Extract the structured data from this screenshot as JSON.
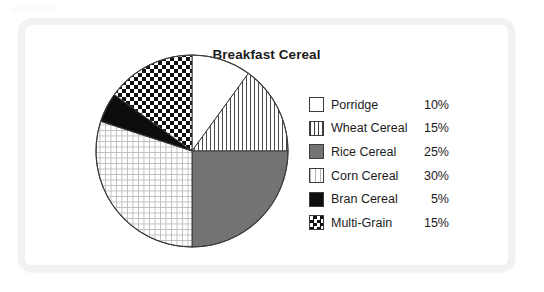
{
  "card": {
    "background_color": "#ffffff",
    "border_color": "#f2f2f2"
  },
  "chart_data": {
    "type": "pie",
    "title": "Breakfast Cereal",
    "xlabel": "",
    "ylabel": "",
    "legend_position": "right",
    "start_angle_deg": 0,
    "direction": "clockwise",
    "categories": [
      "Porridge",
      "Wheat Cereal",
      "Rice Cereal",
      "Corn Cereal",
      "Bran Cereal",
      "Multi-Grain"
    ],
    "values": [
      10,
      15,
      25,
      30,
      5,
      15
    ],
    "value_labels": [
      "10%",
      "15%",
      "25%",
      "30%",
      "5%",
      "15%"
    ],
    "slices": [
      {
        "label": "Porridge",
        "value": 10,
        "value_label": "10%",
        "pattern": "empty",
        "swatch_class": "sw-empty",
        "fill": "#ffffff",
        "start_deg": 0,
        "end_deg": 36
      },
      {
        "label": "Wheat Cereal",
        "value": 15,
        "value_label": "15%",
        "pattern": "vertical-lines",
        "swatch_class": "sw-vlines",
        "fill": "url(#pat-vlines)",
        "start_deg": 36,
        "end_deg": 90
      },
      {
        "label": "Rice Cereal",
        "value": 25,
        "value_label": "25%",
        "pattern": "solid-gray",
        "swatch_class": "sw-solidgray",
        "fill": "#737373",
        "start_deg": 90,
        "end_deg": 180
      },
      {
        "label": "Corn Cereal",
        "value": 30,
        "value_label": "30%",
        "pattern": "grid",
        "swatch_class": "sw-grid",
        "fill": "url(#pat-grid)",
        "start_deg": 180,
        "end_deg": 288
      },
      {
        "label": "Bran Cereal",
        "value": 5,
        "value_label": "5%",
        "pattern": "solid-black",
        "swatch_class": "sw-black",
        "fill": "#0d0d0d",
        "start_deg": 288,
        "end_deg": 306
      },
      {
        "label": "Multi-Grain",
        "value": 15,
        "value_label": "15%",
        "pattern": "checkerboard",
        "swatch_class": "sw-checker",
        "fill": "url(#pat-checker)",
        "start_deg": 306,
        "end_deg": 360
      }
    ],
    "total": 100,
    "units": "percent",
    "outline_color": "#3c3c3c"
  },
  "legend": {
    "rows": [
      {
        "label": "Porridge",
        "value": "10%"
      },
      {
        "label": "Wheat Cereal",
        "value": "15%"
      },
      {
        "label": "Rice Cereal",
        "value": "25%"
      },
      {
        "label": "Corn Cereal",
        "value": "30%"
      },
      {
        "label": "Bran Cereal",
        "value": "5%"
      },
      {
        "label": "Multi-Grain",
        "value": "15%"
      }
    ]
  }
}
